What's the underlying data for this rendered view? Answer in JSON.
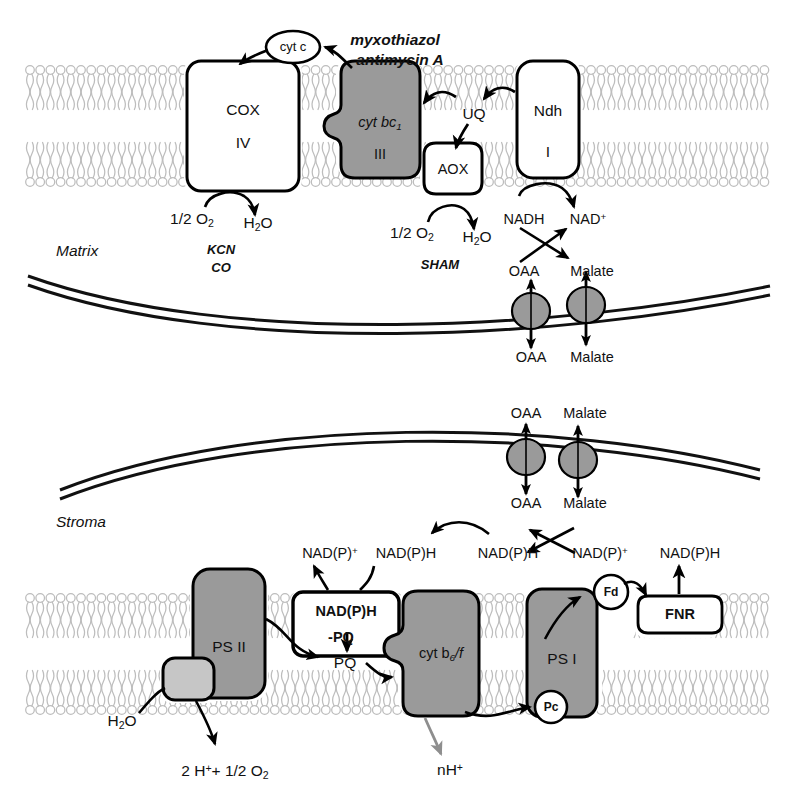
{
  "figure": {
    "colors": {
      "complex_gray": "#9a9a9a",
      "membrane_gray": "#b8b8b8",
      "outline_black": "#000000",
      "psii_light_gray": "#c0c0c0",
      "background": "#ffffff"
    }
  },
  "mitochondrion": {
    "compartment_label": "Matrix",
    "inner_membrane_complexes": [
      {
        "id": "cox",
        "label_line1": "COX",
        "label_line2": "IV",
        "fill": "white"
      },
      {
        "id": "bc1",
        "label_line1": "cyt bc",
        "label_sub": "1",
        "label_line2": "III",
        "fill": "gray"
      },
      {
        "id": "aox",
        "label_line1": "AOX",
        "fill": "white"
      },
      {
        "id": "ndh",
        "label_line1": "Ndh",
        "label_line2": "I",
        "fill": "white"
      }
    ],
    "mobile_carriers": [
      {
        "id": "cytc",
        "label": "cyt c"
      },
      {
        "id": "uq",
        "label": "UQ"
      }
    ],
    "inhibitors": [
      {
        "id": "myxothiazol",
        "label": "myxothiazol"
      },
      {
        "id": "antimycin-a",
        "label": "antimycin A"
      },
      {
        "id": "kcn",
        "label": "KCN"
      },
      {
        "id": "co",
        "label": "CO"
      },
      {
        "id": "sham",
        "label": "SHAM"
      }
    ],
    "substrates": {
      "cox_oxygen": "1/2 O",
      "cox_oxygen_sub": "2",
      "cox_water": "H",
      "cox_water_sub": "2",
      "cox_water_tail": "O",
      "aox_oxygen": "1/2 O",
      "aox_oxygen_sub": "2",
      "aox_water": "H",
      "aox_water_sub": "2",
      "aox_water_tail": "O",
      "nadh": "NADH",
      "nad_plus": "NAD",
      "nad_plus_sup": "+"
    },
    "shuttle": {
      "matrix_side": {
        "oaa": "OAA",
        "malate": "Malate"
      },
      "cytosol_side": {
        "oaa": "OAA",
        "malate": "Malate"
      }
    }
  },
  "chloroplast": {
    "compartment_label": "Stroma",
    "envelope_shuttle": {
      "outside": {
        "oaa": "OAA",
        "malate": "Malate"
      },
      "stroma_side": {
        "oaa": "OAA",
        "malate": "Malate"
      }
    },
    "stroma_pool": [
      {
        "id": "nadp-plus-left",
        "label": "NAD(P)",
        "sup": "+"
      },
      {
        "id": "nadph-left",
        "label": "NAD(P)H",
        "sup": ""
      },
      {
        "id": "nadph-mid",
        "label": "NAD(P)H",
        "sup": ""
      },
      {
        "id": "nadp-plus-mid",
        "label": "NAD(P)",
        "sup": "+"
      },
      {
        "id": "nadph-right",
        "label": "NAD(P)H",
        "sup": ""
      }
    ],
    "thylakoid_complexes": [
      {
        "id": "psii",
        "label": "PS II",
        "fill": "gray"
      },
      {
        "id": "oec",
        "label": "",
        "fill": "light-gray"
      },
      {
        "id": "ndh-pq",
        "label_line1": "NAD(P)H",
        "label_line2": "-PQ",
        "fill": "white"
      },
      {
        "id": "cytb6f",
        "label": "cyt b",
        "label_sub": "6",
        "label_tail": "/f",
        "fill": "gray"
      },
      {
        "id": "psi",
        "label": "PS I",
        "fill": "gray"
      }
    ],
    "mobile_carriers": [
      {
        "id": "pq",
        "label": "PQ"
      },
      {
        "id": "pc",
        "label": "Pc"
      },
      {
        "id": "fd",
        "label": "Fd"
      },
      {
        "id": "fnr",
        "label": "FNR"
      }
    ],
    "substrates": {
      "water": "H",
      "water_sub": "2",
      "water_tail": "O",
      "oxygen_evolution": "2 H",
      "oxygen_evolution_sup": "+",
      "oxygen_evolution_mid": "+ 1/2 O",
      "oxygen_evolution_sub": "2",
      "proton_pump": "nH",
      "proton_pump_sup": "+"
    }
  }
}
